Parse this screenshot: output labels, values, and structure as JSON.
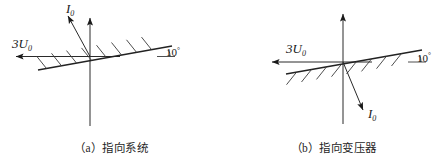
{
  "figure": {
    "panels": [
      {
        "id": "a",
        "caption": "（a）指向系统",
        "voltage_label": "3U",
        "voltage_sub": "0",
        "current_label": "I",
        "current_sub": "0",
        "angle_label": "10",
        "angle_degree_symbol": "°",
        "angle_value_deg": 10,
        "hatch_side": "above",
        "current_direction": "up-left",
        "voltage_direction": "left",
        "vertical_axis_direction": "up"
      },
      {
        "id": "b",
        "caption": "（b）指向变压器",
        "voltage_label": "3U",
        "voltage_sub": "0",
        "current_label": "I",
        "current_sub": "0",
        "angle_label": "10",
        "angle_degree_symbol": "°",
        "angle_value_deg": 10,
        "hatch_side": "below",
        "current_direction": "down-right",
        "voltage_direction": "left",
        "vertical_axis_direction": "up"
      }
    ],
    "colors": {
      "line": "#2a2a2a",
      "boundary": "#222222",
      "hatch": "#3a3a3a",
      "text": "#1a1a1a",
      "background": "#ffffff"
    }
  }
}
